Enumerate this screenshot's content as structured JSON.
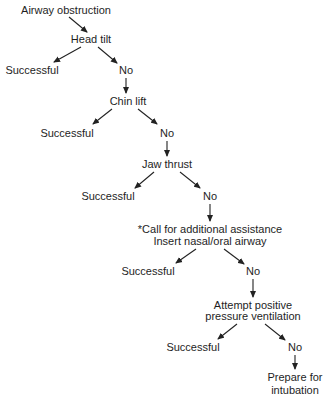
{
  "diagram": {
    "type": "decision-flowchart",
    "colors": {
      "text": "#1e1e1e",
      "arrow": "#222222",
      "background": "#ffffff"
    },
    "nodes": {
      "start": {
        "label": "Airway obstruction"
      },
      "head_tilt": {
        "label": "Head tilt"
      },
      "s1": {
        "label": "Successful"
      },
      "n1": {
        "label": "No"
      },
      "chin_lift": {
        "label": "Chin lift"
      },
      "s2": {
        "label": "Successful"
      },
      "n2": {
        "label": "No"
      },
      "jaw_thrust": {
        "label": "Jaw thrust"
      },
      "s3": {
        "label": "Successful"
      },
      "n3": {
        "label": "No"
      },
      "assist": {
        "line1": "*Call for additional assistance",
        "line2": "Insert nasal/oral airway"
      },
      "s4": {
        "label": "Successful"
      },
      "n4": {
        "label": "No"
      },
      "ppv": {
        "line1": "Attempt positive",
        "line2": "pressure ventilation"
      },
      "s5": {
        "label": "Successful"
      },
      "n5": {
        "label": "No"
      },
      "intubation": {
        "line1": "Prepare for",
        "line2": "intubation"
      }
    },
    "edges": [
      [
        "Airway obstruction",
        "Head tilt"
      ],
      [
        "Head tilt",
        "Successful"
      ],
      [
        "Head tilt",
        "No"
      ],
      [
        "No",
        "Chin lift"
      ],
      [
        "Chin lift",
        "Successful"
      ],
      [
        "Chin lift",
        "No"
      ],
      [
        "No",
        "Jaw thrust"
      ],
      [
        "Jaw thrust",
        "Successful"
      ],
      [
        "Jaw thrust",
        "No"
      ],
      [
        "No",
        "*Call for additional assistance / Insert nasal/oral airway"
      ],
      [
        "Insert nasal/oral airway",
        "Successful"
      ],
      [
        "Insert nasal/oral airway",
        "No"
      ],
      [
        "No",
        "Attempt positive pressure ventilation"
      ],
      [
        "Attempt positive pressure ventilation",
        "Successful"
      ],
      [
        "Attempt positive pressure ventilation",
        "No"
      ],
      [
        "No",
        "Prepare for intubation"
      ]
    ]
  }
}
